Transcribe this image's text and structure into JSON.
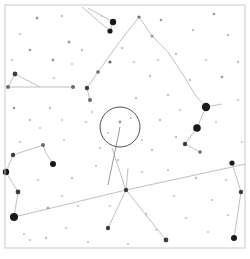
{
  "chart_data": {
    "type": "scatter",
    "title": "",
    "subtitle": "",
    "xlabel": "",
    "ylabel": "",
    "xlim": [
      0,
      250
    ],
    "ylim": [
      0,
      259
    ],
    "grid": false,
    "legend": null,
    "background_color": "#ffffff",
    "frame": {
      "x": 5,
      "y": 5,
      "width": 240,
      "height": 243,
      "stroke": "#c9c9c9",
      "stroke_width": 1
    },
    "star_color": "#1a1a1a",
    "line_color": "#b9b9b9",
    "marker_color": "#555555",
    "stars": [
      {
        "x": 113,
        "y": 22,
        "r": 3.2,
        "mag": 2.0
      },
      {
        "x": 110,
        "y": 31,
        "r": 2.6,
        "mag": 2.6
      },
      {
        "x": 206,
        "y": 107,
        "r": 4.2,
        "mag": 1.2
      },
      {
        "x": 197,
        "y": 128,
        "r": 3.8,
        "mag": 1.5
      },
      {
        "x": 14,
        "y": 217,
        "r": 4.0,
        "mag": 1.3
      },
      {
        "x": 6,
        "y": 172,
        "r": 3.2,
        "mag": 2.0
      },
      {
        "x": 53,
        "y": 164,
        "r": 3.0,
        "mag": 2.2
      },
      {
        "x": 18,
        "y": 192,
        "r": 2.4,
        "mag": 2.8
      },
      {
        "x": 13,
        "y": 155,
        "r": 2.2,
        "mag": 3.0
      },
      {
        "x": 43,
        "y": 145,
        "r": 2.0,
        "mag": 3.2
      },
      {
        "x": 234,
        "y": 238,
        "r": 3.0,
        "mag": 2.2
      },
      {
        "x": 232,
        "y": 163,
        "r": 2.6,
        "mag": 2.6
      },
      {
        "x": 241,
        "y": 192,
        "r": 2.2,
        "mag": 3.0
      },
      {
        "x": 15,
        "y": 74,
        "r": 2.4,
        "mag": 2.8
      },
      {
        "x": 8,
        "y": 87,
        "r": 2.0,
        "mag": 3.2
      },
      {
        "x": 73,
        "y": 87,
        "r": 2.0,
        "mag": 3.2
      },
      {
        "x": 126,
        "y": 190,
        "r": 2.2,
        "mag": 3.0
      },
      {
        "x": 108,
        "y": 228,
        "r": 2.2,
        "mag": 3.0
      },
      {
        "x": 166,
        "y": 240,
        "r": 2.4,
        "mag": 2.8
      },
      {
        "x": 200,
        "y": 152,
        "r": 1.8,
        "mag": 3.4
      },
      {
        "x": 185,
        "y": 144,
        "r": 2.2,
        "mag": 3.0
      },
      {
        "x": 90,
        "y": 100,
        "r": 2.0,
        "mag": 3.2
      },
      {
        "x": 87,
        "y": 88,
        "r": 2.2,
        "mag": 3.0
      },
      {
        "x": 98,
        "y": 72,
        "r": 1.8,
        "mag": 3.4
      },
      {
        "x": 110,
        "y": 62,
        "r": 1.6,
        "mag": 3.6
      },
      {
        "x": 139,
        "y": 17,
        "r": 1.6,
        "mag": 3.6
      },
      {
        "x": 152,
        "y": 36,
        "r": 1.5,
        "mag": 3.7
      },
      {
        "x": 69,
        "y": 42,
        "r": 1.5,
        "mag": 3.7
      },
      {
        "x": 53,
        "y": 60,
        "r": 1.4,
        "mag": 3.8
      },
      {
        "x": 30,
        "y": 50,
        "r": 1.3,
        "mag": 3.9
      },
      {
        "x": 37,
        "y": 18,
        "r": 1.4,
        "mag": 3.8
      },
      {
        "x": 62,
        "y": 16,
        "r": 1.2,
        "mag": 4.0
      },
      {
        "x": 82,
        "y": 50,
        "r": 1.2,
        "mag": 4.0
      },
      {
        "x": 122,
        "y": 48,
        "r": 1.2,
        "mag": 4.0
      },
      {
        "x": 161,
        "y": 20,
        "r": 1.3,
        "mag": 3.9
      },
      {
        "x": 176,
        "y": 54,
        "r": 1.2,
        "mag": 4.0
      },
      {
        "x": 193,
        "y": 30,
        "r": 1.2,
        "mag": 4.0
      },
      {
        "x": 214,
        "y": 14,
        "r": 1.3,
        "mag": 3.9
      },
      {
        "x": 228,
        "y": 35,
        "r": 1.2,
        "mag": 4.0
      },
      {
        "x": 238,
        "y": 62,
        "r": 1.2,
        "mag": 4.0
      },
      {
        "x": 222,
        "y": 77,
        "r": 1.3,
        "mag": 3.9
      },
      {
        "x": 190,
        "y": 80,
        "r": 1.2,
        "mag": 4.0
      },
      {
        "x": 168,
        "y": 95,
        "r": 1.2,
        "mag": 4.0
      },
      {
        "x": 150,
        "y": 76,
        "r": 1.2,
        "mag": 4.0
      },
      {
        "x": 136,
        "y": 98,
        "r": 1.2,
        "mag": 4.0
      },
      {
        "x": 120,
        "y": 122,
        "r": 1.4,
        "mag": 3.8
      },
      {
        "x": 131,
        "y": 118,
        "r": 1.1,
        "mag": 4.1
      },
      {
        "x": 108,
        "y": 133,
        "r": 1.1,
        "mag": 4.1
      },
      {
        "x": 160,
        "y": 120,
        "r": 1.2,
        "mag": 4.0
      },
      {
        "x": 176,
        "y": 137,
        "r": 1.2,
        "mag": 4.0
      },
      {
        "x": 152,
        "y": 150,
        "r": 1.2,
        "mag": 4.0
      },
      {
        "x": 168,
        "y": 170,
        "r": 1.1,
        "mag": 4.1
      },
      {
        "x": 196,
        "y": 178,
        "r": 1.2,
        "mag": 4.0
      },
      {
        "x": 212,
        "y": 200,
        "r": 1.1,
        "mag": 4.1
      },
      {
        "x": 228,
        "y": 215,
        "r": 1.1,
        "mag": 4.1
      },
      {
        "x": 208,
        "y": 232,
        "r": 1.1,
        "mag": 4.1
      },
      {
        "x": 186,
        "y": 218,
        "r": 1.1,
        "mag": 4.1
      },
      {
        "x": 146,
        "y": 214,
        "r": 1.2,
        "mag": 4.0
      },
      {
        "x": 128,
        "y": 244,
        "r": 1.1,
        "mag": 4.1
      },
      {
        "x": 88,
        "y": 242,
        "r": 1.1,
        "mag": 4.1
      },
      {
        "x": 66,
        "y": 228,
        "r": 1.1,
        "mag": 4.1
      },
      {
        "x": 46,
        "y": 238,
        "r": 1.2,
        "mag": 4.0
      },
      {
        "x": 30,
        "y": 240,
        "r": 1.1,
        "mag": 4.1
      },
      {
        "x": 78,
        "y": 206,
        "r": 1.1,
        "mag": 4.1
      },
      {
        "x": 48,
        "y": 208,
        "r": 1.3,
        "mag": 3.9
      },
      {
        "x": 24,
        "y": 234,
        "r": 1.1,
        "mag": 4.1
      },
      {
        "x": 38,
        "y": 180,
        "r": 1.1,
        "mag": 4.1
      },
      {
        "x": 72,
        "y": 178,
        "r": 1.2,
        "mag": 4.0
      },
      {
        "x": 96,
        "y": 166,
        "r": 1.1,
        "mag": 4.1
      },
      {
        "x": 62,
        "y": 196,
        "r": 1.1,
        "mag": 4.1
      },
      {
        "x": 30,
        "y": 120,
        "r": 1.2,
        "mag": 4.0
      },
      {
        "x": 50,
        "y": 108,
        "r": 1.2,
        "mag": 4.0
      },
      {
        "x": 14,
        "y": 108,
        "r": 1.3,
        "mag": 3.9
      },
      {
        "x": 40,
        "y": 128,
        "r": 1.1,
        "mag": 4.1
      },
      {
        "x": 64,
        "y": 140,
        "r": 1.1,
        "mag": 4.1
      },
      {
        "x": 20,
        "y": 142,
        "r": 1.1,
        "mag": 4.1
      },
      {
        "x": 86,
        "y": 122,
        "r": 1.1,
        "mag": 4.1
      },
      {
        "x": 100,
        "y": 148,
        "r": 1.1,
        "mag": 4.1
      },
      {
        "x": 142,
        "y": 140,
        "r": 1.1,
        "mag": 4.1
      },
      {
        "x": 118,
        "y": 160,
        "r": 1.1,
        "mag": 4.1
      },
      {
        "x": 142,
        "y": 172,
        "r": 1.1,
        "mag": 4.1
      },
      {
        "x": 134,
        "y": 62,
        "r": 1.1,
        "mag": 4.1
      },
      {
        "x": 158,
        "y": 60,
        "r": 1.1,
        "mag": 4.1
      },
      {
        "x": 206,
        "y": 60,
        "r": 1.1,
        "mag": 4.1
      },
      {
        "x": 102,
        "y": 16,
        "r": 1.1,
        "mag": 4.1
      },
      {
        "x": 20,
        "y": 34,
        "r": 1.1,
        "mag": 4.1
      },
      {
        "x": 54,
        "y": 78,
        "r": 1.1,
        "mag": 4.1
      },
      {
        "x": 12,
        "y": 60,
        "r": 1.1,
        "mag": 4.1
      },
      {
        "x": 92,
        "y": 112,
        "r": 1.0,
        "mag": 4.2
      },
      {
        "x": 180,
        "y": 110,
        "r": 1.0,
        "mag": 4.2
      },
      {
        "x": 216,
        "y": 122,
        "r": 1.0,
        "mag": 4.2
      },
      {
        "x": 242,
        "y": 142,
        "r": 1.0,
        "mag": 4.2
      },
      {
        "x": 238,
        "y": 100,
        "r": 1.0,
        "mag": 4.2
      },
      {
        "x": 226,
        "y": 180,
        "r": 1.0,
        "mag": 4.2
      },
      {
        "x": 174,
        "y": 196,
        "r": 1.0,
        "mag": 4.2
      },
      {
        "x": 110,
        "y": 206,
        "r": 1.0,
        "mag": 4.2
      },
      {
        "x": 156,
        "y": 230,
        "r": 1.0,
        "mag": 4.2
      },
      {
        "x": 62,
        "y": 120,
        "r": 1.0,
        "mag": 4.2
      },
      {
        "x": 72,
        "y": 64,
        "r": 1.0,
        "mag": 4.2
      }
    ],
    "constellation_lines": [
      {
        "x1": 113,
        "y1": 22,
        "x2": 88,
        "y2": 8
      },
      {
        "x1": 110,
        "y1": 31,
        "x2": 82,
        "y2": 7
      },
      {
        "x1": 113,
        "y1": 22,
        "x2": 110,
        "y2": 31
      },
      {
        "x1": 139,
        "y1": 17,
        "x2": 152,
        "y2": 36
      },
      {
        "x1": 152,
        "y1": 36,
        "x2": 168,
        "y2": 52
      },
      {
        "x1": 168,
        "y1": 52,
        "x2": 185,
        "y2": 78
      },
      {
        "x1": 185,
        "y1": 78,
        "x2": 196,
        "y2": 96
      },
      {
        "x1": 196,
        "y1": 96,
        "x2": 206,
        "y2": 107
      },
      {
        "x1": 206,
        "y1": 107,
        "x2": 222,
        "y2": 104
      },
      {
        "x1": 197,
        "y1": 128,
        "x2": 206,
        "y2": 107
      },
      {
        "x1": 197,
        "y1": 128,
        "x2": 185,
        "y2": 144
      },
      {
        "x1": 185,
        "y1": 144,
        "x2": 200,
        "y2": 152
      },
      {
        "x1": 139,
        "y1": 17,
        "x2": 118,
        "y2": 44
      },
      {
        "x1": 118,
        "y1": 44,
        "x2": 98,
        "y2": 72
      },
      {
        "x1": 98,
        "y1": 72,
        "x2": 87,
        "y2": 88
      },
      {
        "x1": 87,
        "y1": 88,
        "x2": 90,
        "y2": 100
      },
      {
        "x1": 15,
        "y1": 74,
        "x2": 8,
        "y2": 87
      },
      {
        "x1": 15,
        "y1": 74,
        "x2": 40,
        "y2": 87
      },
      {
        "x1": 8,
        "y1": 87,
        "x2": 40,
        "y2": 87
      },
      {
        "x1": 40,
        "y1": 87,
        "x2": 73,
        "y2": 87
      },
      {
        "x1": 6,
        "y1": 172,
        "x2": 13,
        "y2": 155
      },
      {
        "x1": 13,
        "y1": 155,
        "x2": 43,
        "y2": 145
      },
      {
        "x1": 43,
        "y1": 145,
        "x2": 46,
        "y2": 153
      },
      {
        "x1": 46,
        "y1": 153,
        "x2": 53,
        "y2": 164
      },
      {
        "x1": 6,
        "y1": 172,
        "x2": 18,
        "y2": 192
      },
      {
        "x1": 18,
        "y1": 192,
        "x2": 14,
        "y2": 217
      },
      {
        "x1": 14,
        "y1": 217,
        "x2": 126,
        "y2": 190
      },
      {
        "x1": 126,
        "y1": 190,
        "x2": 246,
        "y2": 164
      },
      {
        "x1": 126,
        "y1": 190,
        "x2": 108,
        "y2": 228
      },
      {
        "x1": 126,
        "y1": 190,
        "x2": 166,
        "y2": 240
      },
      {
        "x1": 126,
        "y1": 190,
        "x2": 128,
        "y2": 168
      },
      {
        "x1": 126,
        "y1": 190,
        "x2": 112,
        "y2": 148
      },
      {
        "x1": 232,
        "y1": 163,
        "x2": 241,
        "y2": 192
      },
      {
        "x1": 241,
        "y1": 192,
        "x2": 234,
        "y2": 238
      }
    ],
    "fov_circle": {
      "cx": 120,
      "cy": 127,
      "r": 20,
      "stroke": "#555555",
      "stroke_width": 1,
      "fill": "none"
    },
    "pointer_line": {
      "x1": 120,
      "y1": 127,
      "x2": 108,
      "y2": 185,
      "stroke": "#999999",
      "stroke_width": 1
    }
  }
}
